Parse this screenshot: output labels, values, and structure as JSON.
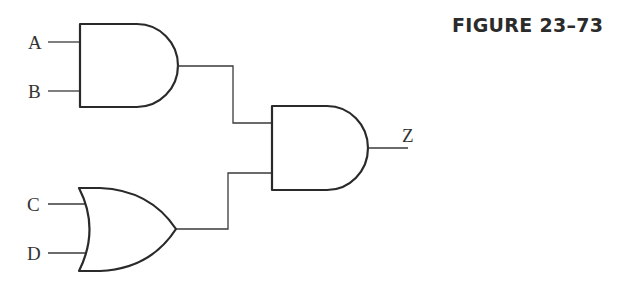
{
  "figure": {
    "title": "FIGURE 23–73"
  },
  "circuit": {
    "inputs": [
      {
        "label": "A",
        "gate": "and1"
      },
      {
        "label": "B",
        "gate": "and1"
      },
      {
        "label": "C",
        "gate": "or1"
      },
      {
        "label": "D",
        "gate": "or1"
      }
    ],
    "gates": [
      {
        "id": "and1",
        "type": "AND",
        "inputs": [
          "A",
          "B"
        ]
      },
      {
        "id": "or1",
        "type": "OR",
        "inputs": [
          "C",
          "D"
        ]
      },
      {
        "id": "and2",
        "type": "AND",
        "inputs": [
          "and1",
          "or1"
        ],
        "output": "Z"
      }
    ],
    "output": {
      "label": "Z"
    }
  },
  "colors": {
    "stroke": "#2a2a2a",
    "background": "#ffffff"
  }
}
